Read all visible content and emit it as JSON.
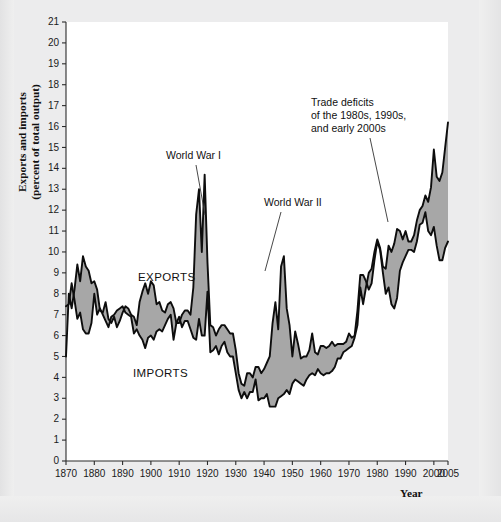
{
  "figure": {
    "background_color": "#ececed",
    "plot_background_color": "#ffffff",
    "band_color": "#a0a0a0",
    "line_color": "#0d0d0d"
  },
  "axes": {
    "ylabel_line1": "Exports and imports",
    "ylabel_line2": "(percent of total output)",
    "xlabel": "Year",
    "ytick_labels": [
      "0",
      "1",
      "2",
      "3",
      "4",
      "5",
      "6",
      "7",
      "8",
      "9",
      "10",
      "11",
      "12",
      "13",
      "14",
      "15",
      "16",
      "17",
      "18",
      "19",
      "20",
      "21"
    ],
    "xtick_labels": [
      "1870",
      "1880",
      "1890",
      "1900",
      "1910",
      "1920",
      "1930",
      "1940",
      "1950",
      "1960",
      "1970",
      "1980",
      "1990",
      "2000",
      "2005"
    ]
  },
  "series_labels": {
    "exports": "EXPORTS",
    "imports": "IMPORTS"
  },
  "annotations": [
    {
      "name": "world-war-i",
      "text": "World War I"
    },
    {
      "name": "world-war-ii",
      "text": "World War II"
    },
    {
      "name": "trade-deficits-line1",
      "text": "Trade deficits"
    },
    {
      "name": "trade-deficits-line2",
      "text": "of the 1980s, 1990s,"
    },
    {
      "name": "trade-deficits-line3",
      "text": "and early 2000s"
    }
  ],
  "chart_data": {
    "type": "area",
    "title": "",
    "xlabel": "Year",
    "ylabel": "Exports and imports (percent of total output)",
    "xlim": [
      1870,
      2005
    ],
    "ylim": [
      0,
      21
    ],
    "grid": false,
    "legend": "inline-labels",
    "xticks": [
      1870,
      1880,
      1890,
      1900,
      1910,
      1920,
      1930,
      1940,
      1950,
      1960,
      1970,
      1980,
      1990,
      2000,
      2005
    ],
    "yticks": [
      0,
      1,
      2,
      3,
      4,
      5,
      6,
      7,
      8,
      9,
      10,
      11,
      12,
      13,
      14,
      15,
      16,
      17,
      18,
      19,
      20,
      21
    ],
    "x": [
      1870,
      1871,
      1872,
      1873,
      1874,
      1875,
      1876,
      1877,
      1878,
      1879,
      1880,
      1881,
      1882,
      1883,
      1884,
      1885,
      1886,
      1887,
      1888,
      1889,
      1890,
      1891,
      1892,
      1893,
      1894,
      1895,
      1896,
      1897,
      1898,
      1899,
      1900,
      1901,
      1902,
      1903,
      1904,
      1905,
      1906,
      1907,
      1908,
      1909,
      1910,
      1911,
      1912,
      1913,
      1914,
      1915,
      1916,
      1917,
      1918,
      1919,
      1920,
      1921,
      1922,
      1923,
      1924,
      1925,
      1926,
      1927,
      1928,
      1929,
      1930,
      1931,
      1932,
      1933,
      1934,
      1935,
      1936,
      1937,
      1938,
      1939,
      1940,
      1941,
      1942,
      1943,
      1944,
      1945,
      1946,
      1947,
      1948,
      1949,
      1950,
      1951,
      1952,
      1953,
      1954,
      1955,
      1956,
      1957,
      1958,
      1959,
      1960,
      1961,
      1962,
      1963,
      1964,
      1965,
      1966,
      1967,
      1968,
      1969,
      1970,
      1971,
      1972,
      1973,
      1974,
      1975,
      1976,
      1977,
      1978,
      1979,
      1980,
      1981,
      1982,
      1983,
      1984,
      1985,
      1986,
      1987,
      1988,
      1989,
      1990,
      1991,
      1992,
      1993,
      1994,
      1995,
      1996,
      1997,
      1998,
      1999,
      2000,
      2001,
      2002,
      2003,
      2004,
      2005
    ],
    "series": [
      {
        "name": "EXPORTS",
        "values": [
          5.0,
          8.0,
          7.3,
          8.2,
          9.4,
          8.6,
          9.8,
          9.3,
          9.1,
          8.5,
          8.6,
          8.2,
          7.2,
          7.1,
          7.6,
          6.8,
          6.6,
          6.9,
          6.4,
          6.7,
          7.1,
          7.4,
          7.3,
          7.0,
          6.9,
          6.5,
          7.6,
          8.1,
          8.5,
          8.0,
          8.6,
          8.4,
          7.5,
          7.6,
          7.2,
          7.1,
          7.5,
          7.6,
          7.3,
          6.6,
          6.6,
          7.0,
          7.2,
          7.2,
          7.0,
          8.3,
          11.8,
          13.0,
          10.0,
          13.7,
          9.5,
          6.5,
          6.4,
          6.0,
          6.3,
          6.5,
          6.5,
          6.3,
          6.1,
          6.1,
          5.3,
          4.2,
          3.7,
          3.6,
          4.2,
          4.2,
          4.0,
          4.5,
          4.5,
          4.2,
          4.4,
          4.7,
          5.0,
          6.6,
          7.6,
          6.3,
          9.3,
          9.8,
          7.3,
          6.5,
          5.0,
          6.2,
          5.6,
          4.9,
          5.0,
          5.0,
          5.3,
          6.1,
          5.2,
          5.1,
          5.5,
          5.5,
          5.4,
          5.5,
          5.7,
          5.5,
          5.6,
          5.6,
          5.6,
          5.7,
          6.1,
          5.9,
          6.0,
          7.2,
          8.9,
          8.9,
          8.6,
          8.2,
          8.5,
          9.6,
          10.5,
          10.1,
          9.0,
          8.0,
          8.3,
          7.5,
          7.3,
          7.8,
          9.1,
          9.5,
          9.8,
          10.1,
          10.1,
          10.0,
          10.5,
          11.3,
          11.4,
          11.9,
          11.0,
          10.8,
          11.2,
          10.3,
          9.6,
          9.6,
          10.2,
          10.5
        ]
      },
      {
        "name": "IMPORTS",
        "values": [
          7.4,
          7.5,
          8.5,
          7.7,
          6.8,
          7.1,
          6.3,
          6.1,
          6.1,
          6.6,
          8.0,
          7.0,
          7.3,
          7.0,
          6.7,
          6.4,
          6.9,
          7.0,
          7.2,
          7.3,
          7.4,
          7.1,
          7.0,
          6.9,
          6.1,
          6.3,
          6.0,
          5.8,
          5.4,
          5.9,
          6.0,
          5.8,
          6.2,
          6.3,
          6.2,
          6.5,
          6.8,
          7.0,
          5.8,
          6.6,
          6.9,
          6.4,
          6.7,
          6.7,
          6.3,
          5.9,
          5.8,
          6.8,
          6.0,
          6.0,
          8.1,
          5.2,
          5.3,
          5.5,
          5.1,
          5.5,
          5.7,
          5.2,
          5.0,
          5.0,
          4.2,
          3.4,
          3.0,
          3.3,
          3.0,
          3.3,
          3.3,
          3.9,
          2.9,
          3.0,
          3.0,
          3.2,
          2.6,
          2.6,
          2.6,
          3.0,
          3.1,
          3.2,
          3.4,
          3.2,
          3.7,
          3.9,
          3.8,
          3.7,
          3.6,
          3.9,
          4.1,
          4.2,
          4.1,
          4.4,
          4.2,
          4.1,
          4.2,
          4.2,
          4.3,
          4.5,
          4.9,
          4.9,
          5.2,
          5.3,
          5.4,
          5.5,
          5.9,
          6.5,
          8.3,
          7.5,
          8.3,
          9.0,
          9.2,
          10.0,
          10.6,
          10.2,
          9.3,
          9.2,
          10.3,
          10.0,
          10.4,
          11.1,
          11.0,
          10.6,
          11.0,
          10.5,
          10.5,
          10.8,
          11.5,
          12.0,
          12.2,
          12.7,
          12.4,
          13.1,
          14.9,
          13.6,
          13.4,
          13.8,
          15.0,
          16.2
        ]
      }
    ],
    "notes": [
      "Shaded band between the EXPORTS and IMPORTS curves.",
      "Spikes during World War I (1916-1919) reach about 13.7 percent.",
      "World War II spike near 1944 reaches about 9.8 percent for exports.",
      "Trade deficits from the 1980s onward show imports above exports."
    ]
  }
}
